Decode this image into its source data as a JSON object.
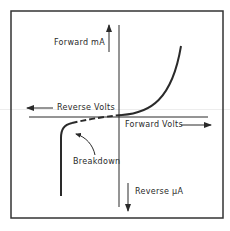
{
  "diagram": {
    "labels": {
      "forward_current": "Forward mA",
      "reverse_voltage": "Reverse Volts",
      "forward_voltage": "Forward Volts",
      "reverse_current": "Reverse μA",
      "breakdown": "Breakdown"
    },
    "colors": {
      "stroke": "#2a2a2a",
      "frame": "#333333",
      "background": "#ffffff"
    }
  }
}
